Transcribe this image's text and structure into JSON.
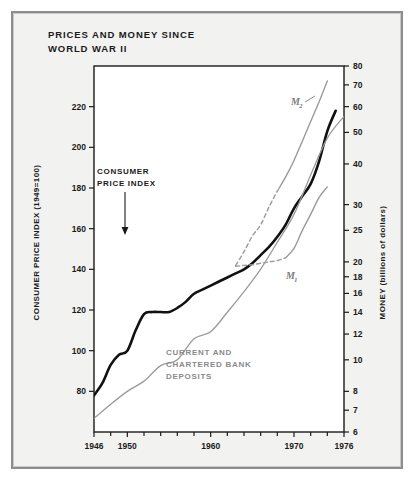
{
  "figure": {
    "title": "PRICES AND MONEY SINCE\nWORLD WAR II",
    "background": "#f2f2f0",
    "frame_color": "#8d8d8d"
  },
  "chart_data": {
    "type": "line",
    "title": "PRICES AND MONEY SINCE WORLD WAR II",
    "subtitle": "",
    "xlabel": "",
    "ylabel": "CONSUMER PRICE INDEX (1949=100)",
    "ylabel_right": "MONEY (billions of dollars)",
    "grid": false,
    "legend_position": "inline-annotations",
    "xlim": [
      1946,
      1976
    ],
    "xticks": [
      1946,
      1950,
      1960,
      1970,
      1976
    ],
    "xtick_labels": [
      "1946",
      "1950",
      "1960",
      "1970",
      "1976"
    ],
    "xticks_minor": [
      1948,
      1952,
      1954,
      1956,
      1958,
      1962,
      1964,
      1966,
      1968,
      1972,
      1974
    ],
    "left_axis": {
      "label": "CONSUMER PRICE INDEX (1949=100)",
      "scale": "linear",
      "ylim": [
        60,
        240
      ],
      "ticks": [
        80,
        100,
        120,
        140,
        160,
        180,
        200,
        220
      ],
      "tick_labels": [
        "80",
        "100",
        "120",
        "140",
        "160",
        "180",
        "200",
        "220"
      ]
    },
    "right_axis": {
      "label": "MONEY (billions of dollars)",
      "scale": "log",
      "ylim": [
        6,
        80
      ],
      "ticks": [
        6,
        7,
        8,
        10,
        12,
        14,
        16,
        18,
        20,
        25,
        30,
        40,
        50,
        60,
        70,
        80
      ],
      "tick_labels": [
        "6",
        "7",
        "8",
        "10",
        "12",
        "14",
        "16",
        "18",
        "20",
        "25",
        "30",
        "40",
        "50",
        "60",
        "70",
        "80"
      ]
    },
    "series": [
      {
        "name": "CONSUMER PRICE INDEX",
        "axis": "left",
        "color": "#111111",
        "style": "solid",
        "width": 2.6,
        "annotation": "CONSUMER\nPRICE INDEX",
        "x": [
          1946,
          1947,
          1948,
          1949,
          1950,
          1951,
          1952,
          1953,
          1954,
          1955,
          1956,
          1957,
          1958,
          1959,
          1960,
          1961,
          1962,
          1963,
          1964,
          1965,
          1966,
          1967,
          1968,
          1969,
          1970,
          1971,
          1972,
          1973,
          1974,
          1975
        ],
        "y": [
          78,
          84,
          93,
          98,
          100,
          110,
          118,
          119,
          119,
          119,
          121,
          124,
          128,
          130,
          132,
          134,
          136,
          138,
          140,
          143,
          147,
          151,
          156,
          162,
          170,
          176,
          182,
          193,
          208,
          218
        ]
      },
      {
        "name": "CURRENT AND CHARTERED BANK DEPOSITS",
        "axis": "right",
        "color": "#9a9a9a",
        "style": "solid",
        "width": 1.3,
        "annotation": "CURRENT AND\nCHARTERED BANK\nDEPOSITS",
        "x": [
          1946,
          1948,
          1950,
          1952,
          1954,
          1956,
          1958,
          1960,
          1962,
          1964,
          1966,
          1968,
          1970,
          1972,
          1974,
          1976
        ],
        "y": [
          6.6,
          7.3,
          8.0,
          8.6,
          9.6,
          10.0,
          11.6,
          12.2,
          14.0,
          16.2,
          19.0,
          23.0,
          28.0,
          37.0,
          48.0,
          56.0
        ]
      },
      {
        "name": "M2",
        "axis": "right",
        "color": "#9a9a9a",
        "style": "dashed-then-solid",
        "width": 1.4,
        "annotation": "M₂",
        "x": [
          1963,
          1964,
          1965,
          1966,
          1967,
          1968,
          1969,
          1970,
          1971,
          1972,
          1973,
          1974
        ],
        "y": [
          19.5,
          21.5,
          24.0,
          26.0,
          29.5,
          33.0,
          36.5,
          41.0,
          47.0,
          54.0,
          62.0,
          72.0
        ],
        "dashed_until": 1968
      },
      {
        "name": "M1",
        "axis": "right",
        "color": "#9a9a9a",
        "style": "dashed-then-solid",
        "width": 1.4,
        "annotation": "M₁",
        "x": [
          1963,
          1964,
          1965,
          1966,
          1967,
          1968,
          1969,
          1970,
          1971,
          1972,
          1973,
          1974
        ],
        "y": [
          19.4,
          19.5,
          19.6,
          19.8,
          20.0,
          20.2,
          20.6,
          22.0,
          25.0,
          28.0,
          31.5,
          34.0
        ],
        "dashed_until": 1969
      }
    ]
  },
  "annotations": {
    "cpi_line1": "CONSUMER",
    "cpi_line2": "PRICE INDEX",
    "deposits_line1": "CURRENT AND",
    "deposits_line2": "CHARTERED BANK",
    "deposits_line3": "DEPOSITS",
    "m1_label": "M",
    "m1_sub": "1",
    "m2_label": "M",
    "m2_sub": "2"
  },
  "axis_titles": {
    "left": "CONSUMER PRICE INDEX (1949=100)",
    "right": "MONEY (billions of dollars)"
  }
}
